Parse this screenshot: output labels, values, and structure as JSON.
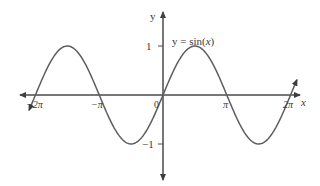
{
  "chart_data": {
    "type": "line",
    "title": "",
    "function_label": "y = sin(x)",
    "function_label_parts": {
      "prefix": "y = sin(",
      "var": "x",
      "suffix": ")"
    },
    "xlabel": "x",
    "ylabel": "y",
    "xlim": [
      -6.9,
      6.9
    ],
    "ylim": [
      -1.45,
      1.45
    ],
    "grid": false,
    "legend": "none",
    "x_ticks": [
      {
        "value": -6.2832,
        "label": "−2π"
      },
      {
        "value": -3.1416,
        "label": "−π"
      },
      {
        "value": 0,
        "label": "0"
      },
      {
        "value": 3.1416,
        "label": "π"
      },
      {
        "value": 6.2832,
        "label": "2π"
      }
    ],
    "y_ticks": [
      {
        "value": 1,
        "label": "1"
      },
      {
        "value": -1,
        "label": "−1"
      }
    ],
    "series": [
      {
        "name": "sin(x)",
        "x": [
          -6.6,
          -6.2832,
          -4.7124,
          -3.1416,
          -1.5708,
          0,
          1.5708,
          3.1416,
          4.7124,
          6.2832,
          6.6
        ],
        "values": [
          -0.311,
          0,
          1,
          0,
          -1,
          0,
          1,
          0,
          -1,
          0,
          0.311
        ],
        "color": "#5a5a5a",
        "arrows": "both-ends"
      }
    ]
  },
  "layout": {
    "origin_px": [
      163,
      95
    ],
    "px_per_unit_x": 20.3,
    "px_per_unit_y": 49,
    "axis_color": "#4a4a4a",
    "curve_color": "#5e5e5e"
  }
}
